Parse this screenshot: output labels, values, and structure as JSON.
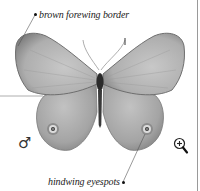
{
  "illustration": {
    "subject": "butterfly",
    "sex_symbol": "♂",
    "colors": {
      "wing_fill": "#a9a9a9",
      "wing_light": "#c4c4c4",
      "wing_border": "#7c7c7c",
      "body": "#2b2b2b",
      "eyespot_ring": "#d9d9d9",
      "eyespot_center": "#3a3a3a",
      "leader_line": "#555555"
    }
  },
  "annotations": [
    {
      "label": "brown forewing border"
    },
    {
      "label": "hindwing eyespots"
    }
  ],
  "controls": {
    "zoom_icon": "magnifier-plus-icon"
  }
}
